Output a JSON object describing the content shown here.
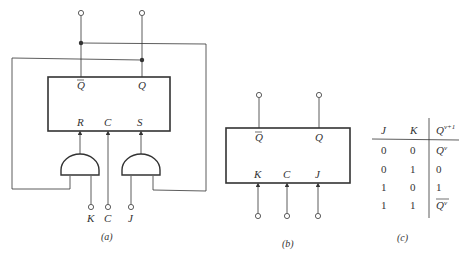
{
  "figure_a": {
    "caption": "(a)",
    "box_labels": {
      "qbar": "Q",
      "q": "Q",
      "r": "R",
      "c": "C",
      "s": "S"
    },
    "inputs": {
      "k": "K",
      "c": "C",
      "j": "J"
    }
  },
  "figure_b": {
    "caption": "(b)",
    "box_labels": {
      "qbar": "Q",
      "q": "Q",
      "k": "K",
      "c": "C",
      "j": "J"
    }
  },
  "figure_c": {
    "caption": "(c)",
    "headers": {
      "j": "J",
      "k": "K",
      "q": "Q",
      "q_sup": "v+1"
    },
    "rows": [
      {
        "j": "0",
        "k": "0",
        "q": "Q",
        "q_sup": "v",
        "bar": false
      },
      {
        "j": "0",
        "k": "1",
        "q": "0",
        "q_sup": "",
        "bar": false
      },
      {
        "j": "1",
        "k": "0",
        "q": "1",
        "q_sup": "",
        "bar": false
      },
      {
        "j": "1",
        "k": "1",
        "q": "Q",
        "q_sup": "v",
        "bar": true
      }
    ]
  },
  "colors": {
    "ink": "#333333",
    "background": "#ffffff"
  }
}
